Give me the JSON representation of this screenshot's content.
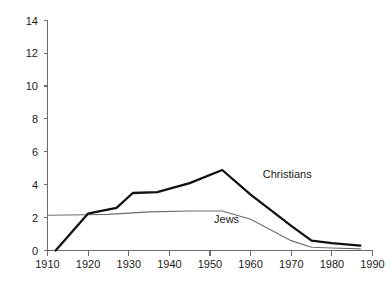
{
  "chart_data": {
    "type": "line",
    "title": "",
    "subtitle": "",
    "xlabel": "",
    "ylabel": "",
    "xlim": [
      1910,
      1990
    ],
    "ylim": [
      0,
      14
    ],
    "grid": false,
    "legend_position": "inline-annotation",
    "x_ticks": [
      "1910",
      "1920",
      "1930",
      "1940",
      "1950",
      "1960",
      "1970",
      "1980",
      "1990"
    ],
    "y_ticks": [
      "0",
      "2",
      "4",
      "6",
      "8",
      "10",
      "12",
      "14"
    ],
    "series": [
      {
        "name": "Christians",
        "style": "thick-black",
        "color": "#111111",
        "annotation": "Christians",
        "x": [
          1912,
          1920,
          1922,
          1927,
          1931,
          1937,
          1945,
          1953,
          1960,
          1970,
          1975,
          1980,
          1987
        ],
        "values": [
          0.0,
          2.25,
          2.35,
          2.6,
          3.5,
          3.55,
          4.1,
          4.9,
          3.4,
          1.5,
          0.6,
          0.45,
          0.3
        ]
      },
      {
        "name": "Jews",
        "style": "thin-gray",
        "color": "#6d6d6d",
        "annotation": "Jews",
        "x": [
          1910,
          1920,
          1925,
          1935,
          1945,
          1953,
          1960,
          1970,
          1975,
          1980,
          1987
        ],
        "values": [
          2.15,
          2.18,
          2.2,
          2.35,
          2.4,
          2.4,
          1.9,
          0.6,
          0.2,
          0.15,
          0.1
        ]
      }
    ],
    "annotations": [
      {
        "text": "Christians",
        "x": 1963,
        "y": 4.4
      },
      {
        "text": "Jews",
        "x": 1951,
        "y": 1.7
      }
    ]
  }
}
